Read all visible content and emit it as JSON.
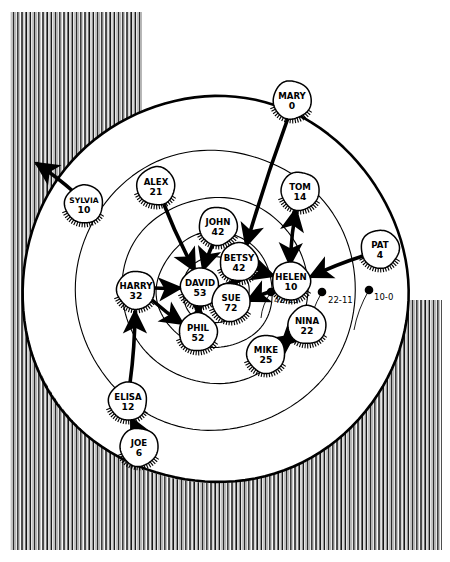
{
  "diagram": {
    "type": "sociogram-target-diagram",
    "center": {
      "x": 215,
      "y": 290
    },
    "rings": [
      {
        "name": "outer-ring",
        "r": 193,
        "stroke_width": 2.6
      },
      {
        "name": "ring-4",
        "r": 140,
        "stroke_width": 1.1
      },
      {
        "name": "ring-3",
        "r": 93,
        "stroke_width": 1.1
      },
      {
        "name": "ring-2",
        "r": 58,
        "stroke_width": 1.1
      },
      {
        "name": "ring-1",
        "r": 33,
        "stroke_width": 1.1
      }
    ],
    "ring_markers": [
      {
        "label": "42-23",
        "dot_x": 271,
        "dot_y": 292,
        "tip_x": 261,
        "tip_y": 318,
        "label_x": 274,
        "label_y": 303
      },
      {
        "label": "22-11",
        "dot_x": 322,
        "dot_y": 292,
        "tip_x": 308,
        "tip_y": 330,
        "label_x": 328,
        "label_y": 303
      },
      {
        "label": "10-0",
        "dot_x": 369,
        "dot_y": 290,
        "tip_x": 354,
        "tip_y": 330,
        "label_x": 374,
        "label_y": 300
      }
    ],
    "hatch": {
      "line_color": "#111111",
      "description": "vertical pen hatching outside the outer circle"
    },
    "colors": {
      "ink": "#000000",
      "paper": "#ffffff",
      "node_fill": "#ffffff"
    }
  },
  "nodes": [
    {
      "id": "mary",
      "name": "MARY",
      "score": "0",
      "x": 292,
      "y": 100,
      "r": 19
    },
    {
      "id": "sylvia",
      "name": "SYLVIA",
      "score": "10",
      "x": 84,
      "y": 204,
      "r": 19
    },
    {
      "id": "alex",
      "name": "ALEX",
      "score": "21",
      "x": 156,
      "y": 186,
      "r": 19
    },
    {
      "id": "tom",
      "name": "TOM",
      "score": "14",
      "x": 300,
      "y": 191,
      "r": 19
    },
    {
      "id": "john",
      "name": "JOHN",
      "score": "42",
      "x": 218,
      "y": 226,
      "r": 19
    },
    {
      "id": "pat",
      "name": "PAT",
      "score": "4",
      "x": 380,
      "y": 249,
      "r": 19
    },
    {
      "id": "betsy",
      "name": "BETSY",
      "score": "42",
      "x": 239,
      "y": 262,
      "r": 19
    },
    {
      "id": "helen",
      "name": "HELEN",
      "score": "10",
      "x": 291,
      "y": 281,
      "r": 19
    },
    {
      "id": "harry",
      "name": "HARRY",
      "score": "32",
      "x": 136,
      "y": 290,
      "r": 19
    },
    {
      "id": "david",
      "name": "DAVID",
      "score": "53",
      "x": 200,
      "y": 287,
      "r": 19
    },
    {
      "id": "sue",
      "name": "SUE",
      "score": "72",
      "x": 231,
      "y": 302,
      "r": 19
    },
    {
      "id": "nina",
      "name": "NINA",
      "score": "22",
      "x": 307,
      "y": 325,
      "r": 19
    },
    {
      "id": "phil",
      "name": "PHIL",
      "score": "52",
      "x": 198,
      "y": 332,
      "r": 19
    },
    {
      "id": "mike",
      "name": "MIKE",
      "score": "25",
      "x": 266,
      "y": 354,
      "r": 19
    },
    {
      "id": "elisa",
      "name": "ELISA",
      "score": "12",
      "x": 128,
      "y": 401,
      "r": 19
    },
    {
      "id": "joe",
      "name": "JOE",
      "score": "6",
      "x": 139,
      "y": 447,
      "r": 19
    }
  ],
  "edges": [
    {
      "from": "sylvia",
      "to": "outside-upper-left",
      "x1": 75,
      "y1": 193,
      "x2": 36,
      "y2": 163,
      "double": false
    },
    {
      "from": "alex",
      "to": "david",
      "x1": 163,
      "y1": 202,
      "x2": 195,
      "y2": 271,
      "double": false
    },
    {
      "from": "mary",
      "to": "betsy",
      "x1": 288,
      "y1": 118,
      "x2": 246,
      "y2": 246,
      "double": false
    },
    {
      "from": "john",
      "to": "david",
      "x1": 213,
      "y1": 244,
      "x2": 203,
      "y2": 270,
      "double": false
    },
    {
      "from": "tom",
      "to": "helen",
      "x1": 296,
      "y1": 209,
      "x2": 290,
      "y2": 265,
      "double": true
    },
    {
      "from": "betsy",
      "to": "helen",
      "x1": 255,
      "y1": 268,
      "x2": 274,
      "y2": 276,
      "double": false
    },
    {
      "from": "betsy",
      "to": "sue",
      "x1": 236,
      "y1": 280,
      "x2": 231,
      "y2": 286,
      "double": true
    },
    {
      "from": "pat",
      "to": "helen",
      "x1": 363,
      "y1": 256,
      "x2": 310,
      "y2": 277,
      "double": false
    },
    {
      "from": "helen",
      "to": "sue",
      "x1": 275,
      "y1": 290,
      "x2": 247,
      "y2": 301,
      "double": false
    },
    {
      "from": "harry",
      "to": "david",
      "x1": 154,
      "y1": 288,
      "x2": 181,
      "y2": 288,
      "double": false
    },
    {
      "from": "harry",
      "to": "phil",
      "x1": 152,
      "y1": 300,
      "x2": 183,
      "y2": 324,
      "double": false
    },
    {
      "from": "david",
      "to": "phil",
      "x1": 199,
      "y1": 306,
      "x2": 199,
      "y2": 314,
      "double": true
    },
    {
      "from": "nina",
      "to": "mike",
      "x1": 294,
      "y1": 335,
      "x2": 281,
      "y2": 346,
      "double": true
    },
    {
      "from": "elisa",
      "to": "harry",
      "x1": 130,
      "y1": 383,
      "x2": 135,
      "y2": 311,
      "double": false
    },
    {
      "from": "joe",
      "to": "elisa",
      "x1": 136,
      "y1": 430,
      "x2": 131,
      "y2": 418,
      "double": false
    }
  ]
}
